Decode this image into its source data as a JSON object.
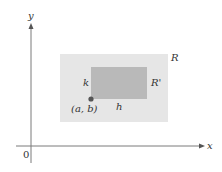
{
  "diagram": {
    "axes": {
      "x_label": "x",
      "y_label": "y",
      "origin_label": "0",
      "color": "#7a7a7a"
    },
    "outer_region": {
      "label": "R",
      "color": "#e6e6e6"
    },
    "inner_region": {
      "label": "R'",
      "color": "#b9b9b9"
    },
    "corner_point": {
      "label": "(a, b)",
      "color": "#555555"
    },
    "width_label": "h",
    "height_label": "k"
  }
}
